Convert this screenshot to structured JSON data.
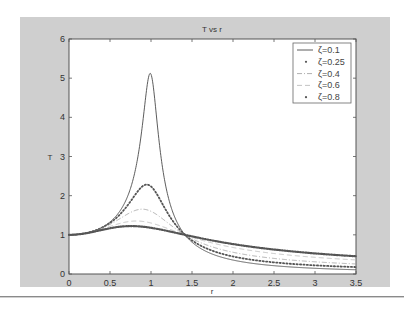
{
  "chart_data": {
    "type": "line",
    "title": "T vs r",
    "xlabel": "r",
    "ylabel": "T",
    "xlim": [
      0,
      3.5
    ],
    "ylim": [
      0,
      6
    ],
    "xticks": [
      "0",
      "0.5",
      "1",
      "1.5",
      "2",
      "2.5",
      "3",
      "3.5"
    ],
    "yticks": [
      "0",
      "1",
      "2",
      "3",
      "4",
      "5",
      "6"
    ],
    "grid": false,
    "legend_position": "upper right",
    "x": [
      0,
      0.5,
      0.75,
      0.9,
      1.0,
      1.1,
      1.25,
      1.5,
      2.0,
      2.5,
      3.0,
      3.5
    ],
    "series": [
      {
        "name": "ζ=0.1",
        "zeta": 0.1,
        "style": "solid",
        "color": "#4a4a4a",
        "values": [
          1.0,
          1.329,
          2.186,
          3.882,
          5.099,
          3.367,
          1.675,
          0.812,
          0.356,
          0.212,
          0.145,
          0.108
        ]
      },
      {
        "name": "ζ=0.25",
        "zeta": 0.25,
        "style": "dotted",
        "color": "#555555",
        "values": [
          1.0,
          1.304,
          1.853,
          2.245,
          2.236,
          1.939,
          1.402,
          0.858,
          0.447,
          0.297,
          0.221,
          0.177
        ]
      },
      {
        "name": "ζ=0.4",
        "zeta": 0.4,
        "style": "dashdot",
        "color": "#9a9a9a",
        "values": [
          1.0,
          1.267,
          1.571,
          1.655,
          1.601,
          1.472,
          1.233,
          0.901,
          0.555,
          0.398,
          0.311,
          0.256
        ]
      },
      {
        "name": "ζ=0.6",
        "zeta": 0.6,
        "style": "dashed",
        "color": "#b5b5b5",
        "values": [
          1.0,
          1.214,
          1.344,
          1.342,
          1.302,
          1.239,
          1.125,
          0.94,
          0.677,
          0.523,
          0.426,
          0.36
        ]
      },
      {
        "name": "ζ=0.8",
        "zeta": 0.8,
        "style": "marker-dense",
        "color": "#555555",
        "values": [
          1.0,
          1.168,
          1.223,
          1.207,
          1.179,
          1.142,
          1.076,
          0.961,
          0.764,
          0.625,
          0.526,
          0.453
        ]
      }
    ]
  }
}
